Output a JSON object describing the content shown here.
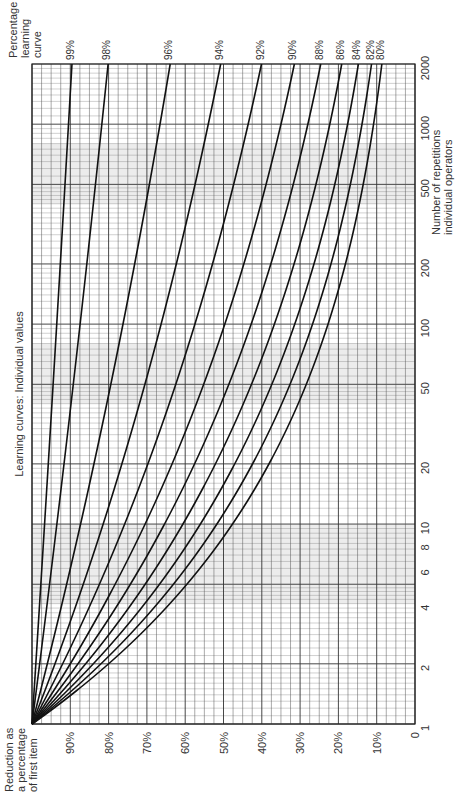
{
  "chart_data": {
    "type": "line",
    "title": "Learning curves: Individual values",
    "orientation": "rotated 90° counter-clockwise (x-axis runs vertically on right side)",
    "xlabel": "Number of repetitions individual operators",
    "ylabel": "Reduction as a percentage of first item",
    "legend_title": "Percentage learning curve",
    "x_scale": "log",
    "xlim": [
      1,
      2000
    ],
    "ylim": [
      0,
      100
    ],
    "x_ticks": [
      1,
      2,
      4,
      6,
      8,
      10,
      20,
      50,
      100,
      200,
      500,
      1000,
      2000
    ],
    "y_ticks": [
      "0",
      "10%",
      "20%",
      "30%",
      "40%",
      "50%",
      "60%",
      "70%",
      "80%",
      "90%"
    ],
    "grid": true,
    "formula": "y = 100 * n^(log2(p))",
    "series": [
      {
        "name": "99%",
        "rate": 0.99,
        "value_at_2000": 89.5
      },
      {
        "name": "98%",
        "rate": 0.98,
        "value_at_2000": 80.0
      },
      {
        "name": "96%",
        "rate": 0.96,
        "value_at_2000": 64.0
      },
      {
        "name": "94%",
        "rate": 0.94,
        "value_at_2000": 51.0
      },
      {
        "name": "92%",
        "rate": 0.92,
        "value_at_2000": 41.0
      },
      {
        "name": "90%",
        "rate": 0.9,
        "value_at_2000": 32.7
      },
      {
        "name": "88%",
        "rate": 0.88,
        "value_at_2000": 26.2
      },
      {
        "name": "86%",
        "rate": 0.86,
        "value_at_2000": 20.9
      },
      {
        "name": "84%",
        "rate": 0.84,
        "value_at_2000": 16.7
      },
      {
        "name": "82%",
        "rate": 0.82,
        "value_at_2000": 13.3
      },
      {
        "name": "80%",
        "rate": 0.8,
        "value_at_2000": 10.6
      }
    ]
  },
  "labels": {
    "title": "Learning curves: Individual values",
    "y_axis_title": [
      "Reduction as",
      "a percentage",
      "of first item"
    ],
    "x_axis_title": [
      "Number of repetitions",
      "individual operators"
    ],
    "legend_title": [
      "Percentage",
      "learning",
      "curve"
    ]
  }
}
